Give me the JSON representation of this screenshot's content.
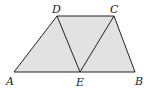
{
  "figure": {
    "fill_color": "#e2e2e2",
    "stroke_color": "#222222",
    "points": {
      "A": {
        "x": 14,
        "y": 72,
        "label": "A",
        "lx": 6,
        "ly": 85
      },
      "E": {
        "x": 80,
        "y": 72,
        "label": "E",
        "lx": 76,
        "ly": 86
      },
      "B": {
        "x": 135,
        "y": 72,
        "label": "B",
        "lx": 136,
        "ly": 85
      },
      "C": {
        "x": 114,
        "y": 16,
        "label": "C",
        "lx": 110,
        "ly": 13
      },
      "D": {
        "x": 57,
        "y": 16,
        "label": "D",
        "lx": 52,
        "ly": 13
      }
    },
    "segments": [
      "AB",
      "BC",
      "CD",
      "DA",
      "DE",
      "CE"
    ]
  }
}
